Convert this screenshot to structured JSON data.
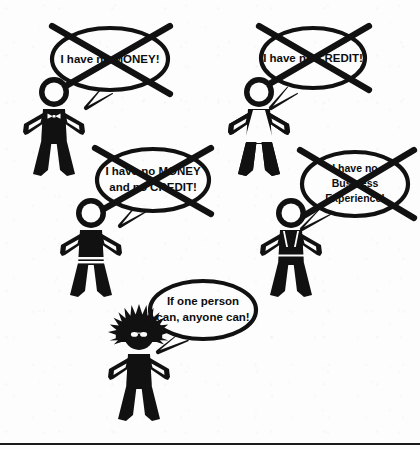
{
  "image": {
    "title": "If one person can, anyone can",
    "style": "black-and-white stick figure cartoon",
    "background_color": "#fdfdfd",
    "ink_color": "#111111",
    "width": 420,
    "height": 449
  },
  "bottom_rule": {
    "present": true,
    "y": 443,
    "color": "#1a1a1a"
  },
  "excuses": [
    {
      "id": "no-money",
      "lines": [
        "I have no MONEY!"
      ],
      "crossed_out": true,
      "speaker": "figure-bowtie"
    },
    {
      "id": "no-credit",
      "lines": [
        "I have no CREDIT!"
      ],
      "crossed_out": true,
      "speaker": "figure-dress"
    },
    {
      "id": "no-money-no-credit",
      "lines": [
        "I have no MONEY",
        "and no CREDIT!"
      ],
      "crossed_out": true,
      "speaker": "figure-skirt"
    },
    {
      "id": "no-business-experience",
      "lines": [
        "I have no",
        "Business",
        "Experience!"
      ],
      "crossed_out": true,
      "speaker": "figure-suspenders"
    }
  ],
  "conclusion": {
    "id": "anyone-can",
    "lines": [
      "If one person",
      "can, anyone can!"
    ],
    "crossed_out": false,
    "speaker": "figure-hero"
  },
  "figures": [
    {
      "id": "figure-bowtie",
      "accessory": "bow-tie",
      "pose": "hands-on-hips"
    },
    {
      "id": "figure-dress",
      "accessory": "dress",
      "pose": "hands-on-hips"
    },
    {
      "id": "figure-skirt",
      "accessory": "striped-skirt",
      "pose": "hands-on-hips"
    },
    {
      "id": "figure-suspenders",
      "accessory": "suspenders-belt",
      "pose": "hands-on-hips"
    },
    {
      "id": "figure-hero",
      "accessory": "starburst-halo",
      "pose": "hands-on-hips"
    }
  ]
}
